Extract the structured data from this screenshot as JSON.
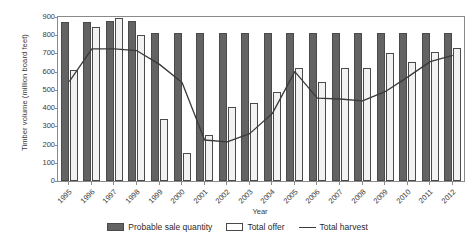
{
  "chart_data": {
    "type": "bar",
    "title": "",
    "xlabel": "Year",
    "ylabel": "Timber volume (million board feet)",
    "categories": [
      "1995",
      "1996",
      "1997",
      "1998",
      "1999",
      "2000",
      "2001",
      "2002",
      "2003",
      "2004",
      "2005",
      "2006",
      "2007",
      "2008",
      "2009",
      "2010",
      "2011",
      "2012"
    ],
    "ylim": [
      0,
      900
    ],
    "ytick_values": [
      900,
      800,
      700,
      600,
      500,
      400,
      300,
      200,
      100,
      0
    ],
    "ytick_labels": [
      "900",
      "800",
      "700",
      "600",
      "500",
      "400",
      "300",
      "200",
      "100",
      "0"
    ],
    "grid": false,
    "legend_position": "bottom",
    "series": [
      {
        "name": "Probable sale quantity",
        "kind": "bar",
        "color": "#636363",
        "values": [
          875,
          875,
          880,
          880,
          815,
          815,
          815,
          815,
          815,
          815,
          815,
          815,
          815,
          815,
          815,
          815,
          815,
          815
        ]
      },
      {
        "name": "Total offer",
        "kind": "bar",
        "color": "#f2f2f2",
        "values": [
          610,
          845,
          895,
          800,
          340,
          155,
          250,
          405,
          430,
          490,
          620,
          545,
          620,
          620,
          705,
          655,
          710,
          730
        ]
      },
      {
        "name": "Total harvest",
        "kind": "line",
        "color": "#3a3a3a",
        "values": [
          545,
          725,
          725,
          715,
          640,
          540,
          225,
          215,
          260,
          370,
          600,
          455,
          450,
          440,
          490,
          570,
          655,
          690
        ]
      }
    ]
  },
  "legend": {
    "items": [
      {
        "label": "Probable sale quantity",
        "marker": "dark-bar-swatch"
      },
      {
        "label": "Total offer",
        "marker": "light-bar-swatch"
      },
      {
        "label": "Total harvest",
        "marker": "line-swatch"
      }
    ]
  }
}
